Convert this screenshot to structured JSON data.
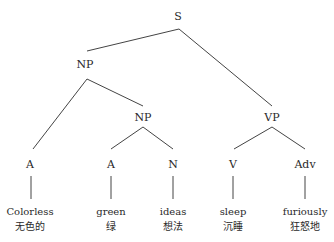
{
  "tree": {
    "nodes": {
      "S": "S",
      "NP": "NP",
      "NP2": "NP",
      "VP": "VP",
      "A1": "A",
      "A2": "A",
      "N": "N",
      "V": "V",
      "Adv": "Adv"
    },
    "leaves": [
      {
        "en": "Colorless",
        "zh": "无色的"
      },
      {
        "en": "green",
        "zh": "绿"
      },
      {
        "en": "ideas",
        "zh": "想法"
      },
      {
        "en": "sleep",
        "zh": "沉睡"
      },
      {
        "en": "furiously",
        "zh": "狂怒地"
      }
    ]
  }
}
